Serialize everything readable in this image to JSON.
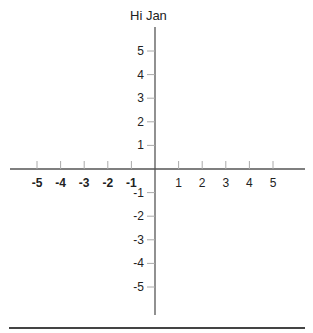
{
  "title": "Hi Jan",
  "chart_data": {
    "type": "coordinate-plane",
    "title": "Hi Jan",
    "x_ticks": [
      -5,
      -4,
      -3,
      -2,
      -1,
      1,
      2,
      3,
      4,
      5
    ],
    "y_ticks": [
      5,
      4,
      3,
      2,
      1,
      -1,
      -2,
      -3,
      -4,
      -5
    ],
    "xlim": [
      -6,
      6
    ],
    "ylim": [
      -6,
      6
    ],
    "grid": false
  },
  "labels": {
    "x": [
      "-5",
      "-4",
      "-3",
      "-2",
      "-1",
      "1",
      "2",
      "3",
      "4",
      "5"
    ],
    "y": [
      "5",
      "4",
      "3",
      "2",
      "1",
      "-1",
      "-2",
      "-3",
      "-4",
      "-5"
    ]
  },
  "colors": {
    "axis": "#555555",
    "tick": "#aaaaaa",
    "text": "#222222",
    "rule": "#444444"
  }
}
